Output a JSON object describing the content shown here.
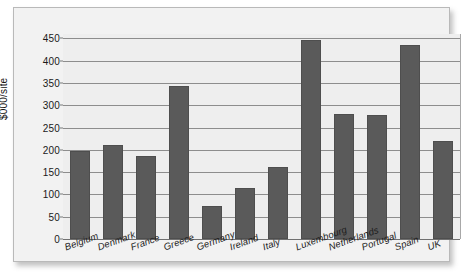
{
  "chart_data": {
    "type": "bar",
    "title": "",
    "subtitle": "",
    "xlabel": "",
    "ylabel": "$000/site",
    "ylim": [
      0,
      460
    ],
    "yticks": [
      0,
      50,
      100,
      150,
      200,
      250,
      300,
      350,
      400,
      450
    ],
    "ytick_labels": [
      "0",
      "50",
      "100",
      "150",
      "200",
      "250",
      "300",
      "350",
      "400",
      "450"
    ],
    "grid": true,
    "legend": false,
    "legend_position": "none",
    "bar_color": "#5a5a5a",
    "plot_background": "#eeeeee",
    "panel_background": "#f2f2f2",
    "categories": [
      "Belgium",
      "Denmark",
      "France",
      "Greece",
      "Germany",
      "Ireland",
      "Italy",
      "Luxembourg",
      "Netherlands",
      "Portugal",
      "Spain",
      "UK"
    ],
    "values": [
      197,
      211,
      186,
      343,
      73,
      114,
      161,
      446,
      280,
      279,
      436,
      221
    ]
  }
}
